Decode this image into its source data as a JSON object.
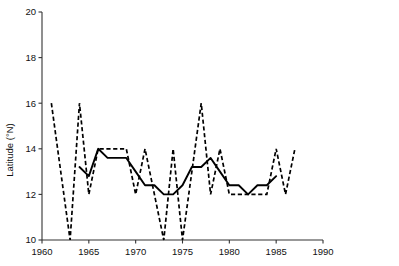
{
  "chart_data": {
    "type": "line",
    "title": "",
    "subtitle": "",
    "xlabel": "",
    "ylabel": "Latitude (°N)",
    "xlim": [
      1960,
      1990
    ],
    "ylim": [
      10,
      20
    ],
    "grid": false,
    "legend": "none",
    "x_ticks": [
      1960,
      1965,
      1970,
      1975,
      1980,
      1985,
      1990
    ],
    "x_tick_labels": [
      "1960",
      "1965",
      "1970",
      "1975",
      "1980",
      "1985",
      "1990"
    ],
    "y_ticks": [
      10,
      12,
      14,
      16,
      18,
      20
    ],
    "y_tick_labels": [
      "10",
      "12",
      "14",
      "16",
      "18",
      "20"
    ],
    "series": [
      {
        "name": "annual",
        "style": "dashed",
        "color": "#000000",
        "x": [
          1961,
          1962,
          1963,
          1964,
          1965,
          1966,
          1967,
          1968,
          1969,
          1970,
          1971,
          1972,
          1973,
          1974,
          1975,
          1976,
          1977,
          1978,
          1979,
          1980,
          1981,
          1982,
          1983,
          1984,
          1985,
          1986,
          1987
        ],
        "values": [
          16.0,
          13.0,
          10.0,
          16.0,
          12.0,
          14.0,
          14.0,
          14.0,
          14.0,
          12.0,
          14.0,
          12.0,
          10.0,
          14.0,
          10.0,
          13.0,
          16.0,
          12.0,
          14.0,
          12.0,
          12.0,
          12.0,
          12.0,
          12.0,
          14.0,
          12.0,
          14.0
        ]
      },
      {
        "name": "smoothed",
        "style": "solid",
        "color": "#000000",
        "x": [
          1964,
          1965,
          1966,
          1967,
          1968,
          1969,
          1970,
          1971,
          1972,
          1973,
          1974,
          1975,
          1976,
          1977,
          1978,
          1979,
          1980,
          1981,
          1982,
          1983,
          1984,
          1985
        ],
        "values": [
          13.2,
          12.8,
          14.0,
          13.6,
          13.6,
          13.6,
          13.0,
          12.4,
          12.4,
          12.0,
          12.0,
          12.4,
          13.2,
          13.2,
          13.6,
          13.0,
          12.4,
          12.4,
          12.0,
          12.4,
          12.4,
          12.8
        ]
      }
    ]
  },
  "axes": {
    "y_axis_title": "Latitude (°N)"
  }
}
